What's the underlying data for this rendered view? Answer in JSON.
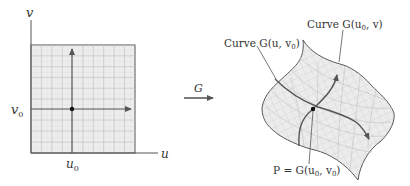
{
  "domain_panel": {
    "axis_u_label": "u",
    "axis_v_label": "v",
    "tick_u0": "u",
    "tick_u0_sub": "0",
    "tick_v0": "v",
    "tick_v0_sub": "0"
  },
  "mapping": {
    "label": "G"
  },
  "surface_panel": {
    "curve_u_label": "Curve G(u, v",
    "curve_u_label_sub": "0",
    "curve_u_label_end": ")",
    "curve_v_label": "Curve G(u",
    "curve_v_label_sub": "0",
    "curve_v_label_end": ", v)",
    "point_label": "P = G(u",
    "point_label_sub1": "0",
    "point_label_mid": ", v",
    "point_label_sub2": "0",
    "point_label_end": ")"
  },
  "colors": {
    "grid_fill": "#ececec",
    "grid_minor": "#d4d4d4",
    "grid_major": "#c4c4c4",
    "line": "#555555",
    "point": "#111111"
  }
}
